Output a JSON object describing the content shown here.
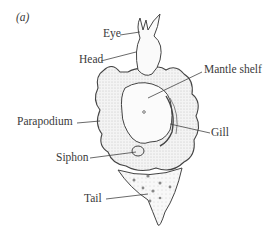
{
  "figure": {
    "panel_label": "(a)",
    "labels": {
      "eye": "Eye",
      "head": "Head",
      "mantle_shelf": "Mantle shelf",
      "parapodium": "Parapodium",
      "gill": "Gill",
      "siphon": "Siphon",
      "tail": "Tail"
    }
  }
}
